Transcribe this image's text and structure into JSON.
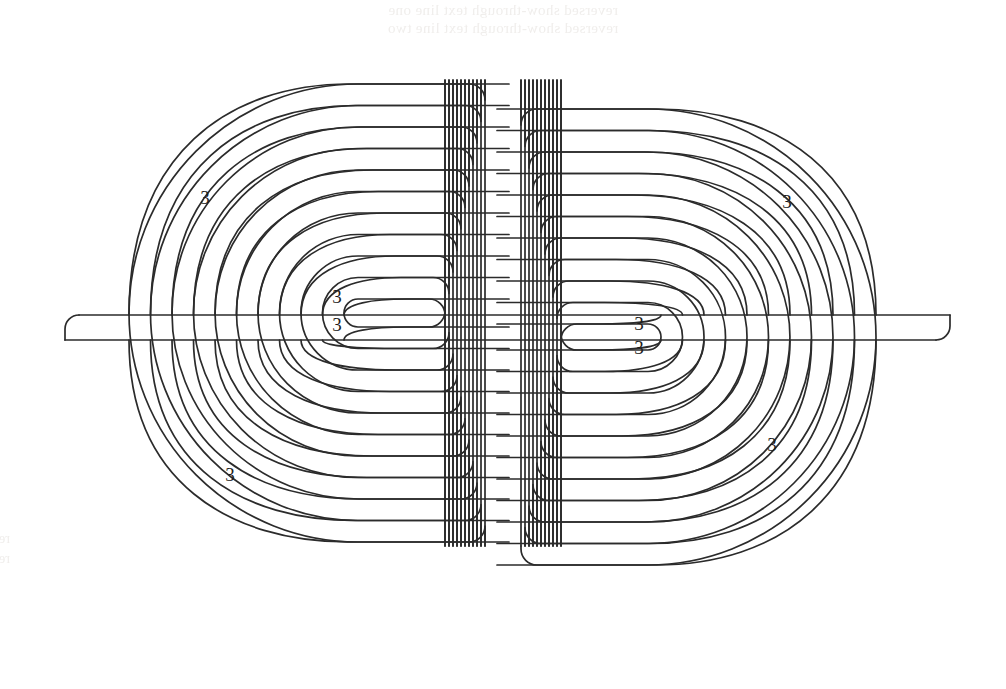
{
  "figure": {
    "kind": "double-spiral-labyrinth-diagram",
    "line_color": "#2b2b2b",
    "background_color": "#ffffff",
    "stroke_width": 1.7,
    "ring_count_per_side": 11,
    "labels": [
      {
        "id": "label-upper-left",
        "text": "3",
        "x": 205,
        "y": 200
      },
      {
        "id": "label-upper-right",
        "text": "3",
        "x": 787,
        "y": 204
      },
      {
        "id": "label-core-left-a",
        "text": "3",
        "x": 337,
        "y": 299
      },
      {
        "id": "label-core-left-b",
        "text": "3",
        "x": 337,
        "y": 327
      },
      {
        "id": "label-core-right-a",
        "text": "3",
        "x": 639,
        "y": 326
      },
      {
        "id": "label-core-right-b",
        "text": "3",
        "x": 639,
        "y": 350
      },
      {
        "id": "label-lower-left",
        "text": "3",
        "x": 230,
        "y": 477
      },
      {
        "id": "label-lower-right",
        "text": "3",
        "x": 772,
        "y": 447
      }
    ],
    "geometry": {
      "left_center_x": 358,
      "left_center_y": 313,
      "right_center_x": 648,
      "right_center_y": 337,
      "ring_spacing": 21.5,
      "outer_boundary_left_x": 65,
      "outer_boundary_right_x": 950,
      "outer_boundary_top_y": 315,
      "outer_boundary_bottom_y": 340
    }
  },
  "show_through": {
    "note": "Faint reverse-side print bleeding through the scanned page; illegible mirrored text",
    "top_line_1": "reversed show-through text line one",
    "top_line_2": "reversed show-through text line two",
    "left_line_1": "reversed show-through",
    "left_line_2": "reversed show-through"
  }
}
